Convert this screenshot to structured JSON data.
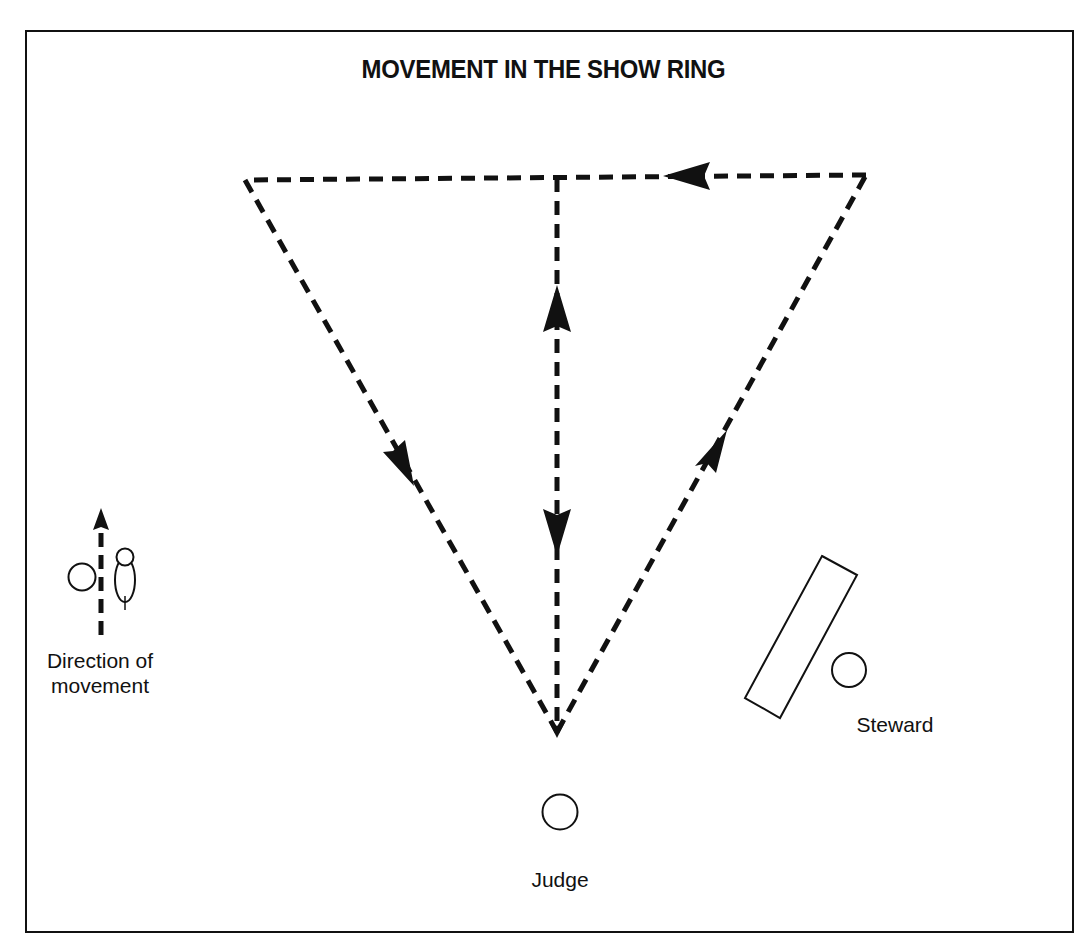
{
  "title": "MOVEMENT IN THE SHOW RING",
  "legend": {
    "label_line1": "Direction of",
    "label_line2": "movement",
    "icon": "dashed-arrow-up-icon"
  },
  "figures": {
    "steward_label": "Steward",
    "judge_label": "Judge"
  },
  "diagram": {
    "pattern": "triangle",
    "vertices": {
      "top_left": [
        245,
        180
      ],
      "top_right": [
        866,
        175
      ],
      "bottom_apex": [
        557,
        735
      ]
    },
    "paths": [
      {
        "name": "right-edge",
        "from": "bottom_apex",
        "to": "top_right",
        "arrow_direction": "up-right"
      },
      {
        "name": "top-edge",
        "from": "top_right",
        "to": "top_left",
        "arrow_direction": "left"
      },
      {
        "name": "left-edge",
        "from": "top_left",
        "to": "bottom_apex",
        "arrow_direction": "down-right"
      },
      {
        "name": "center-line",
        "from": "bottom_apex",
        "to": "top_center",
        "arrow_direction": "up and down"
      }
    ],
    "colors": {
      "ink": "#111111",
      "background": "#ffffff"
    }
  }
}
